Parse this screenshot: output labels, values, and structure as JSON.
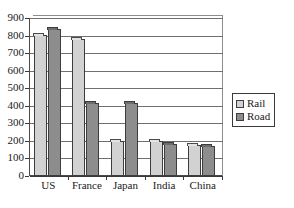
{
  "chart_data": {
    "type": "bar",
    "title": "",
    "subtitle": "",
    "xlabel": "",
    "ylabel": "",
    "categories": [
      "US",
      "France",
      "Japan",
      "India",
      "China"
    ],
    "series": [
      {
        "name": "Rail",
        "color": "#d2d2d2",
        "values": [
          805,
          780,
          200,
          200,
          175
        ]
      },
      {
        "name": "Road",
        "color": "#8d8d8d",
        "values": [
          835,
          415,
          415,
          185,
          172
        ]
      }
    ],
    "ylim": [
      0,
      900
    ],
    "ytick_values": [
      0,
      100,
      200,
      300,
      400,
      500,
      600,
      700,
      800,
      900
    ],
    "ytick_labels": [
      "0",
      "100",
      "200",
      "300",
      "400",
      "500",
      "600",
      "700",
      "800",
      "900"
    ],
    "grid": true,
    "grid_axis": "y",
    "legend": {
      "position": "right",
      "entries": [
        {
          "label": "Rail",
          "color": "#d2d2d2"
        },
        {
          "label": "Road",
          "color": "#8d8d8d"
        }
      ]
    }
  }
}
